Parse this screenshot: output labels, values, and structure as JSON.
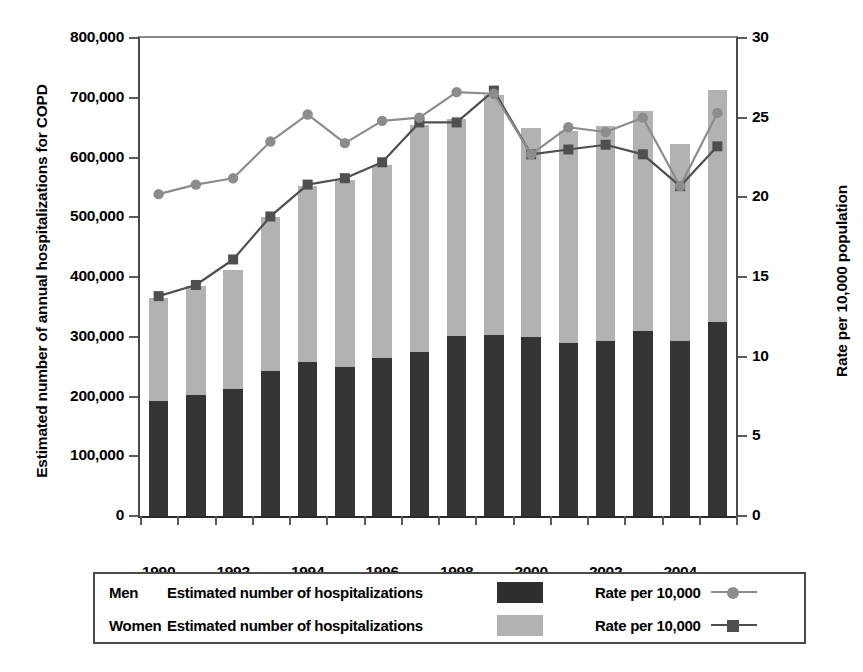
{
  "axes": {
    "y_left_title": "Estimated number of annual hospitalizations for COPD",
    "y_right_title": "Rate per 10,000 population",
    "y_left_ticks": [
      "0",
      "100,000",
      "200,000",
      "300,000",
      "400,000",
      "500,000",
      "600,000",
      "700,000",
      "800,000"
    ],
    "y_right_ticks": [
      "0",
      "5",
      "10",
      "15",
      "20",
      "25",
      "30"
    ],
    "x_ticks": [
      "1990",
      "",
      "1992",
      "",
      "1994",
      "",
      "1996",
      "",
      "1998",
      "",
      "2000",
      "",
      "2002",
      "",
      "2004",
      ""
    ]
  },
  "legend": {
    "rows": [
      {
        "group": "Men",
        "bar_label": "Estimated number of hospitalizations",
        "rate_label": "Rate per 10,000",
        "swatch_color": "#2e2e2e",
        "line_color": "#8c8c8c",
        "marker": "circle"
      },
      {
        "group": "Women",
        "bar_label": "Estimated number of hospitalizations",
        "rate_label": "Rate per 10,000",
        "swatch_color": "#b2b2b2",
        "line_color": "#4f4f4f",
        "marker": "square"
      }
    ]
  },
  "colors": {
    "men_bar": "#343434",
    "women_bar": "#b2b2b2",
    "men_line": "#8c8c8c",
    "women_line": "#4f4f4f",
    "axis": "#4a4a4a",
    "background": "#ffffff"
  },
  "chart_data": {
    "type": "bar",
    "title": "",
    "subtitle": "",
    "xlabel": "",
    "ylabel": "Estimated number of annual hospitalizations for COPD",
    "ylabel_right": "Rate per 10,000 population",
    "x": [
      1990,
      1991,
      1992,
      1993,
      1994,
      1995,
      1996,
      1997,
      1998,
      1999,
      2000,
      2001,
      2002,
      2003,
      2004,
      2005
    ],
    "categories": [
      "1990",
      "1991",
      "1992",
      "1993",
      "1994",
      "1995",
      "1996",
      "1997",
      "1998",
      "1999",
      "2000",
      "2001",
      "2002",
      "2003",
      "2004",
      "2005"
    ],
    "ylim": [
      0,
      800000
    ],
    "ylim_right": [
      0,
      30
    ],
    "ytick_step": 100000,
    "ytick_step_right": 5,
    "grid": false,
    "legend_position": "bottom",
    "stacked": true,
    "series": [
      {
        "name": "Men — Estimated number of hospitalizations",
        "axis": "left",
        "render": "bar-stack-bottom",
        "color": "#343434",
        "values": [
          193000,
          203000,
          212000,
          243000,
          258000,
          250000,
          265000,
          274000,
          301000,
          303000,
          300000,
          289000,
          293000,
          309000,
          293000,
          325000
        ]
      },
      {
        "name": "Women — Estimated number of hospitalizations",
        "axis": "left",
        "render": "bar-stack-top",
        "color": "#b2b2b2",
        "values": [
          172000,
          182000,
          200000,
          257000,
          294000,
          312000,
          323000,
          381000,
          364000,
          402000,
          350000,
          356000,
          359000,
          369000,
          329000,
          388000
        ]
      },
      {
        "name": "Men — Rate per 10,000",
        "axis": "right",
        "render": "line-circle",
        "color": "#8c8c8c",
        "values": [
          20.2,
          20.8,
          21.2,
          23.5,
          25.2,
          23.4,
          24.8,
          25.0,
          26.6,
          26.5,
          22.7,
          24.4,
          24.1,
          25.0,
          20.7,
          25.3
        ]
      },
      {
        "name": "Women — Rate per 10,000",
        "axis": "right",
        "render": "line-square",
        "color": "#4f4f4f",
        "values": [
          13.8,
          14.5,
          16.1,
          18.8,
          20.8,
          21.2,
          22.2,
          24.7,
          24.7,
          26.7,
          22.7,
          23.0,
          23.3,
          22.7,
          20.7,
          23.2
        ]
      }
    ],
    "stack_totals": [
      365000,
      385000,
      412000,
      500000,
      552000,
      562000,
      588000,
      655000,
      665000,
      705000,
      650000,
      645000,
      652000,
      678000,
      622000,
      713000
    ]
  }
}
